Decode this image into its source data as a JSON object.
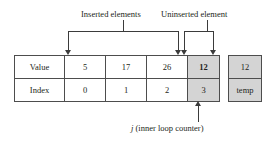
{
  "figure": {
    "colors": {
      "shaded_cell": "#d4d4d4",
      "line": "#3b3b3b",
      "border": "#4d4d4d",
      "text": "#231f20",
      "background": "#ffffff"
    }
  },
  "callouts": {
    "inserted": "Inserted elements",
    "uninserted": "Uninserted element",
    "counter_italic": "j",
    "counter_rest": " (inner loop counter)"
  },
  "array": {
    "row_labels": [
      "Value",
      "Index"
    ],
    "values": [
      "5",
      "17",
      "26",
      "12"
    ],
    "indices": [
      "0",
      "1",
      "2",
      "3"
    ],
    "highlighted_column": 3
  },
  "temp": {
    "value": "12",
    "label": "temp"
  },
  "chart_data": {
    "type": "table",
    "columns": [
      "0",
      "1",
      "2",
      "3"
    ],
    "rows": [
      {
        "name": "Value",
        "values": [
          "5",
          "17",
          "26",
          "12"
        ]
      },
      {
        "name": "Index",
        "values": [
          "0",
          "1",
          "2",
          "3"
        ]
      }
    ],
    "annotations": [
      {
        "text": "Inserted elements",
        "spans_columns": [
          0,
          2
        ]
      },
      {
        "text": "Uninserted element",
        "spans_columns": [
          3,
          3
        ]
      },
      {
        "text": "j (inner loop counter)",
        "points_to_column": 3
      }
    ],
    "aux": {
      "label": "temp",
      "value": "12"
    }
  }
}
